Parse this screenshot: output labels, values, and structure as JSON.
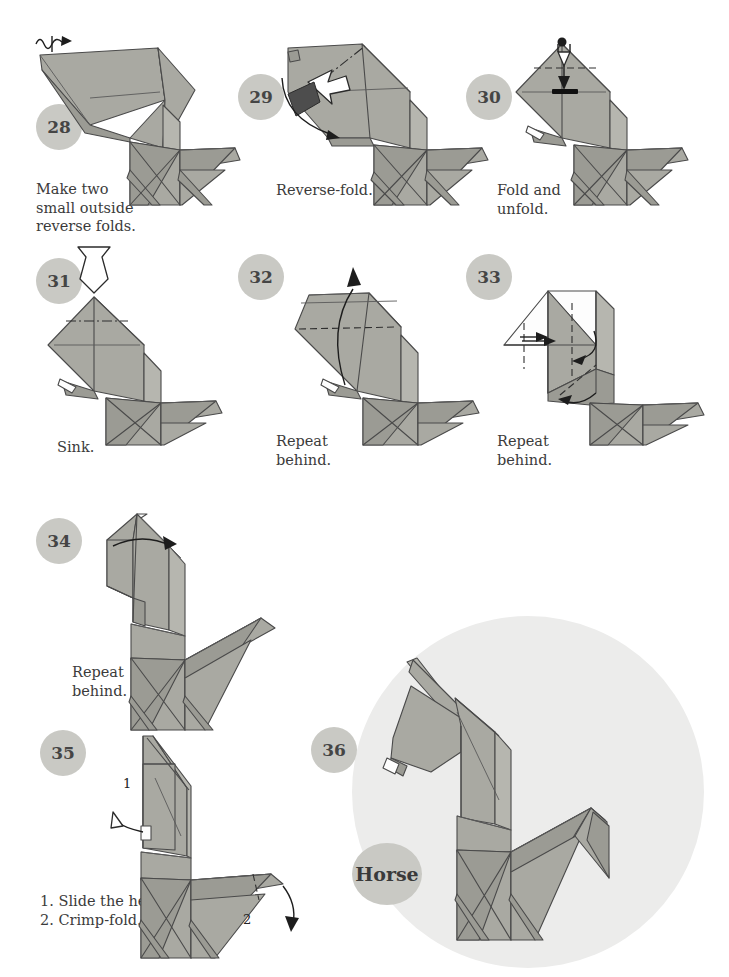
{
  "document": {
    "kind": "origami-instruction-diagram",
    "model_name": "Horse",
    "page_background": "#ffffff",
    "paper_color": "#a9a9a2",
    "paper_shadow_color": "#9b9b94",
    "paper_reverse_color": "#fdfdfd",
    "badge_color": "#c9c9c4",
    "badge_text_color": "#454545",
    "caption_color": "#3b3b3b",
    "final_disc_color": "#ececeb"
  },
  "steps": [
    {
      "number": "28",
      "caption": "Make two\nsmall outside\nreverse folds.",
      "badge": {
        "x": 36,
        "y": 104
      },
      "caption_pos": {
        "x": 36,
        "y": 180
      },
      "figure_pos": {
        "x": 30,
        "y": 30
      },
      "annotations": [
        "crimp-zigzag-arrow"
      ]
    },
    {
      "number": "29",
      "caption": "Reverse-fold.",
      "badge": {
        "x": 238,
        "y": 74
      },
      "caption_pos": {
        "x": 276,
        "y": 181
      },
      "figure_pos": {
        "x": 270,
        "y": 30
      },
      "annotations": [
        "push-arrow",
        "mountain-fold-line",
        "curved-arrow"
      ]
    },
    {
      "number": "30",
      "caption": "Fold and\nunfold.",
      "badge": {
        "x": 466,
        "y": 74
      },
      "caption_pos": {
        "x": 497,
        "y": 181
      },
      "figure_pos": {
        "x": 500,
        "y": 30
      },
      "annotations": [
        "valley-fold-line",
        "fold-and-unfold-arrow",
        "point-marker"
      ]
    },
    {
      "number": "31",
      "caption": "Sink.",
      "badge": {
        "x": 36,
        "y": 258
      },
      "caption_pos": {
        "x": 57,
        "y": 438
      },
      "figure_pos": {
        "x": 30,
        "y": 245
      },
      "annotations": [
        "sink-arrow",
        "mountain-fold-line"
      ]
    },
    {
      "number": "32",
      "caption": "Repeat\nbehind.",
      "badge": {
        "x": 238,
        "y": 254
      },
      "caption_pos": {
        "x": 276,
        "y": 432
      },
      "figure_pos": {
        "x": 265,
        "y": 245
      },
      "annotations": [
        "valley-fold-line",
        "unfold-arrow"
      ]
    },
    {
      "number": "33",
      "caption": "Repeat\nbehind.",
      "badge": {
        "x": 466,
        "y": 254
      },
      "caption_pos": {
        "x": 497,
        "y": 432
      },
      "figure_pos": {
        "x": 490,
        "y": 245
      },
      "annotations": [
        "valley-fold-lines",
        "curved-arrows"
      ]
    },
    {
      "number": "34",
      "caption": "Repeat\nbehind.",
      "badge": {
        "x": 36,
        "y": 518
      },
      "caption_pos": {
        "x": 72,
        "y": 663
      },
      "figure_pos": {
        "x": 85,
        "y": 500
      },
      "annotations": [
        "curved-arrow"
      ]
    },
    {
      "number": "35",
      "caption": "1. Slide the head.\n2. Crimp-fold.",
      "badge": {
        "x": 40,
        "y": 730
      },
      "caption_pos": {
        "x": 40,
        "y": 892
      },
      "figure_pos": {
        "x": 125,
        "y": 728
      },
      "annotations": [
        "slide-arrow",
        "crimp-arrow",
        "label-1",
        "label-2"
      ],
      "inline_labels": [
        "1",
        "2"
      ]
    },
    {
      "number": "36",
      "caption": "",
      "badge": {
        "x": 311,
        "y": 727
      },
      "figure_pos": {
        "x": 395,
        "y": 640
      },
      "final_disc": {
        "x": 352,
        "y": 616,
        "size": 352
      },
      "model_badge": {
        "x": 352,
        "y": 843,
        "label": "Horse"
      }
    }
  ]
}
